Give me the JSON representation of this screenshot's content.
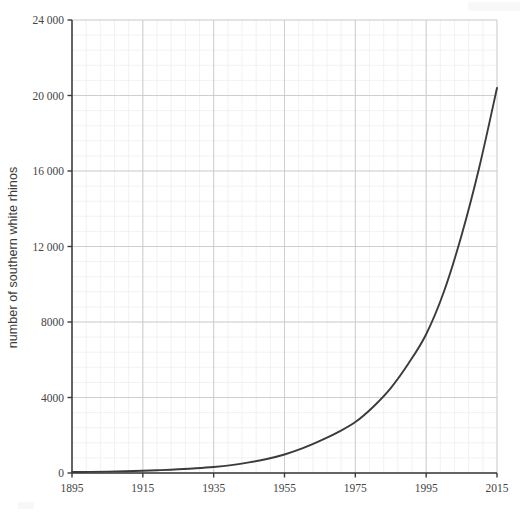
{
  "chart_data": {
    "type": "line",
    "title": "",
    "subtitle": "",
    "xlabel": "",
    "ylabel": "number of southern white rhinos",
    "xlim": [
      1895,
      2015
    ],
    "ylim": [
      0,
      24000
    ],
    "grid": true,
    "minor_grid": true,
    "legend": "none",
    "x_ticks": [
      1895,
      1915,
      1935,
      1955,
      1975,
      1995,
      2015
    ],
    "x_tick_labels": [
      "1895",
      "1915",
      "1935",
      "1955",
      "1975",
      "1995",
      "2015"
    ],
    "y_ticks": [
      0,
      4000,
      8000,
      12000,
      16000,
      20000,
      24000
    ],
    "y_tick_labels": [
      "0",
      "4000",
      "8000",
      "12 000",
      "16 000",
      "20 000",
      "24 000"
    ],
    "x_minor_step": 4,
    "y_minor_step": 800,
    "series": [
      {
        "name": "southern white rhinos",
        "color": "#3b3b3b",
        "x": [
          1895,
          1900,
          1905,
          1910,
          1915,
          1920,
          1925,
          1930,
          1935,
          1940,
          1945,
          1950,
          1955,
          1960,
          1965,
          1970,
          1975,
          1980,
          1985,
          1990,
          1995,
          2000,
          2005,
          2010,
          2015
        ],
        "values": [
          50,
          60,
          75,
          95,
          120,
          150,
          195,
          250,
          320,
          420,
          560,
          740,
          980,
          1300,
          1700,
          2150,
          2700,
          3500,
          4500,
          5800,
          7350,
          9600,
          12600,
          16200,
          20400
        ]
      }
    ],
    "annotations": []
  },
  "axes": {
    "axis_color": "#3a3a3a",
    "major_grid_color": "#c9c9c9",
    "minor_grid_color": "#ececec",
    "tick_label_color": "#444444",
    "plot_background": "#ffffff"
  },
  "watermarks": {
    "top_right": "",
    "bottom_left": ""
  }
}
